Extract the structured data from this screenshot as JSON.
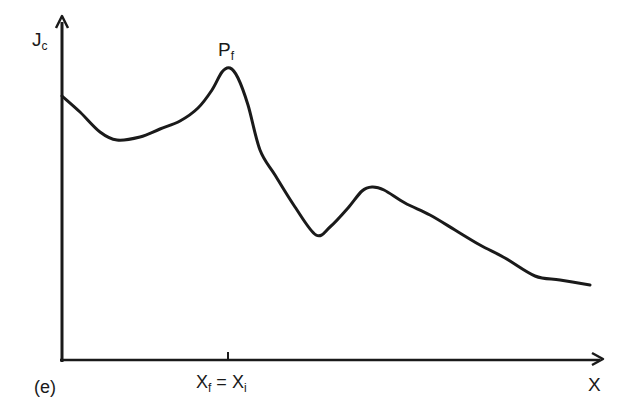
{
  "figure": {
    "panel_label": "(e)",
    "y_axis_label": {
      "main": "J",
      "sub": "c"
    },
    "x_axis_label": "X",
    "peak_label": {
      "main": "P",
      "sub": "f"
    },
    "tick_label": {
      "left_main": "X",
      "left_sub": "f",
      "equals": " = ",
      "right_main": "X",
      "right_sub": "i"
    }
  },
  "chart_data": {
    "type": "line",
    "title": "",
    "xlabel": "X",
    "ylabel": "Jc",
    "grid": false,
    "legend": null,
    "annotations": [
      {
        "text": "Pf",
        "at": "global maximum of curve"
      },
      {
        "text": "Xf = Xi",
        "at": "x tick under peak Pf"
      },
      {
        "text": "(e)",
        "at": "panel label, bottom-left"
      }
    ],
    "x_ticks": [
      "Xf = Xi"
    ],
    "series": [
      {
        "name": "Jc(X)",
        "points_px": [
          [
            62,
            96
          ],
          [
            80,
            112
          ],
          [
            100,
            132
          ],
          [
            117,
            140
          ],
          [
            140,
            137
          ],
          [
            160,
            129
          ],
          [
            180,
            121
          ],
          [
            198,
            108
          ],
          [
            212,
            90
          ],
          [
            222,
            72
          ],
          [
            230,
            68
          ],
          [
            238,
            78
          ],
          [
            248,
            105
          ],
          [
            260,
            150
          ],
          [
            275,
            175
          ],
          [
            295,
            207
          ],
          [
            316,
            235
          ],
          [
            330,
            227
          ],
          [
            348,
            208
          ],
          [
            362,
            191
          ],
          [
            372,
            187
          ],
          [
            384,
            190
          ],
          [
            405,
            203
          ],
          [
            430,
            215
          ],
          [
            455,
            230
          ],
          [
            480,
            245
          ],
          [
            505,
            258
          ],
          [
            535,
            276
          ],
          [
            560,
            280
          ],
          [
            590,
            285
          ]
        ]
      }
    ]
  }
}
